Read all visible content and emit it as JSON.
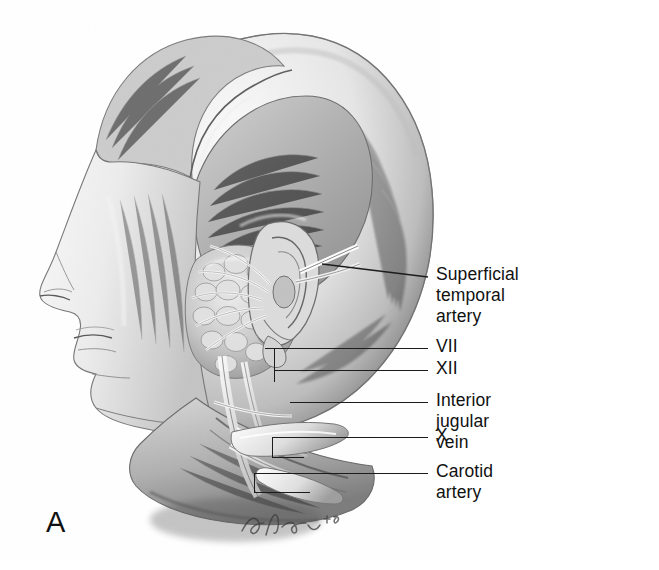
{
  "figure": {
    "panel_letter": "A",
    "kind": "anatomical-illustration",
    "view": "lateral head and neck, parotid region dissection",
    "style": "grayscale pencil / stipple medical illustration",
    "artist_signature": "illegible cursive signature",
    "background_color": "#ffffff",
    "ink_color": "#1c1c1c",
    "text_color": "#111111"
  },
  "callouts": [
    {
      "id": "superficial-temporal-artery",
      "label": "Superficial temporal\nartery",
      "leader": {
        "x1": 333,
        "y1": 264,
        "x2": 428,
        "y2": 277,
        "kind": "angled"
      },
      "text_x": 436,
      "text_y": 265
    },
    {
      "id": "cn-vii",
      "label": "VII",
      "leader": {
        "x1": 265,
        "y1": 348,
        "x2": 428,
        "y2": 348,
        "kind": "straight"
      },
      "text_x": 436,
      "text_y": 337
    },
    {
      "id": "cn-xii",
      "label": "XII",
      "leader": {
        "x1": 274,
        "y1": 381,
        "x2": 428,
        "y2": 370,
        "kind": "stepped"
      },
      "text_x": 436,
      "text_y": 359
    },
    {
      "id": "interior-jugular-vein",
      "label": "Interior jugular vein",
      "leader": {
        "x1": 290,
        "y1": 402,
        "x2": 428,
        "y2": 402,
        "kind": "straight"
      },
      "text_x": 436,
      "text_y": 391
    },
    {
      "id": "cn-x",
      "label": "X",
      "leader": {
        "x1": 272,
        "y1": 457,
        "x2": 428,
        "y2": 437,
        "kind": "stepped"
      },
      "text_x": 436,
      "text_y": 426
    },
    {
      "id": "carotid-artery",
      "label": "Carotid artery",
      "leader": {
        "x1": 254,
        "y1": 492,
        "x2": 428,
        "y2": 473,
        "kind": "stepped"
      },
      "text_x": 436,
      "text_y": 462
    }
  ],
  "illustration_parts": [
    {
      "id": "cranial-vault",
      "label": "cranium / calvarium"
    },
    {
      "id": "scalp-flap",
      "label": "reflected scalp flap"
    },
    {
      "id": "temporalis-muscle",
      "label": "temporalis muscle"
    },
    {
      "id": "face-profile",
      "label": "facial profile with nose, lips, chin"
    },
    {
      "id": "auricle",
      "label": "external ear / auricle"
    },
    {
      "id": "parotid-gland",
      "label": "lobulated parotid gland mass"
    },
    {
      "id": "facial-nerve-branches",
      "label": "facial nerve branches"
    },
    {
      "id": "neck-vessels",
      "label": "great vessels of the neck"
    },
    {
      "id": "retractor",
      "label": "surgical retractor"
    },
    {
      "id": "mandible-ramus",
      "label": "mandibular ramus"
    },
    {
      "id": "sternocleidomastoid",
      "label": "sternocleidomastoid muscle"
    }
  ]
}
